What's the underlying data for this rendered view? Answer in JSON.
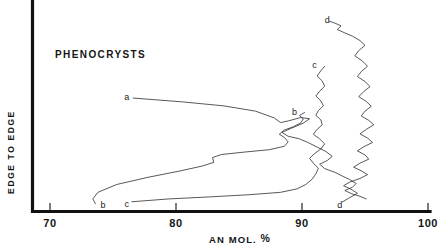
{
  "figure": {
    "title": "PHENOCRYSTS",
    "background_color": "#ffffff",
    "ink_color": "#161616",
    "curve_color": "#3a3a3a"
  },
  "chart_data": {
    "type": "line",
    "title": "PHENOCRYSTS",
    "xlabel": "AN MOL. %",
    "ylabel": "EDGE TO EDGE",
    "xlim": [
      70,
      100
    ],
    "ylim": [
      0,
      1
    ],
    "grid": false,
    "legend": "inline-curve-labels",
    "xticks": [
      70,
      80,
      90,
      100
    ],
    "xticklabels": [
      "70",
      "80",
      "90",
      "100"
    ],
    "yticks": [],
    "yticklabels": [],
    "axis_note": "Y axis is an unscaled traverse position: edge to edge across the crystal. X axis is anorthite content in mole percent.",
    "series": [
      {
        "name": "a",
        "label": "a",
        "label_position": {
          "x": 76.1,
          "y": 0.555
        },
        "points": [
          [
            76.6,
            0.552
          ],
          [
            80.5,
            0.533
          ],
          [
            83.8,
            0.513
          ],
          [
            86.3,
            0.487
          ],
          [
            87.8,
            0.453
          ],
          [
            88.3,
            0.43
          ],
          [
            88.9,
            0.438
          ],
          [
            89.9,
            0.455
          ],
          [
            90.6,
            0.449
          ],
          [
            90.1,
            0.427
          ],
          [
            89.2,
            0.403
          ],
          [
            88.4,
            0.381
          ],
          [
            88.9,
            0.362
          ],
          [
            89.8,
            0.349
          ],
          [
            90.5,
            0.33
          ],
          [
            91.2,
            0.308
          ],
          [
            91.9,
            0.286
          ],
          [
            92.4,
            0.262
          ],
          [
            92.0,
            0.241
          ],
          [
            91.4,
            0.223
          ],
          [
            91.8,
            0.201
          ],
          [
            92.6,
            0.183
          ],
          [
            93.2,
            0.164
          ],
          [
            93.8,
            0.146
          ],
          [
            94.3,
            0.127
          ],
          [
            94.0,
            0.108
          ],
          [
            93.4,
            0.092
          ],
          [
            93.9,
            0.077
          ],
          [
            94.6,
            0.063
          ],
          [
            95.1,
            0.05
          ]
        ]
      },
      {
        "name": "b",
        "label_bottom": "b",
        "label_top": "b",
        "label_bottom_position": {
          "x": 74.2,
          "y": 0.02
        },
        "label_top_position": {
          "x": 89.4,
          "y": 0.485
        },
        "points": [
          [
            73.6,
            0.027
          ],
          [
            73.4,
            0.05
          ],
          [
            73.8,
            0.083
          ],
          [
            75.3,
            0.122
          ],
          [
            77.8,
            0.158
          ],
          [
            80.3,
            0.189
          ],
          [
            82.1,
            0.214
          ],
          [
            83.0,
            0.232
          ],
          [
            82.9,
            0.256
          ],
          [
            83.6,
            0.271
          ],
          [
            85.4,
            0.283
          ],
          [
            87.4,
            0.295
          ],
          [
            88.6,
            0.312
          ],
          [
            88.9,
            0.334
          ],
          [
            88.6,
            0.356
          ],
          [
            88.2,
            0.372
          ],
          [
            88.6,
            0.393
          ],
          [
            89.3,
            0.409
          ],
          [
            89.9,
            0.428
          ],
          [
            90.1,
            0.448
          ],
          [
            89.8,
            0.465
          ],
          [
            90.2,
            0.48
          ]
        ]
      },
      {
        "name": "c",
        "label_bottom": "c",
        "label_top": "c",
        "label_bottom_position": {
          "x": 76.1,
          "y": 0.024
        },
        "label_top_position": {
          "x": 91.0,
          "y": 0.715
        },
        "points": [
          [
            76.5,
            0.036
          ],
          [
            79.4,
            0.05
          ],
          [
            82.6,
            0.06
          ],
          [
            85.8,
            0.071
          ],
          [
            88.3,
            0.083
          ],
          [
            89.6,
            0.1
          ],
          [
            90.3,
            0.122
          ],
          [
            90.8,
            0.148
          ],
          [
            91.1,
            0.175
          ],
          [
            91.3,
            0.203
          ],
          [
            90.9,
            0.228
          ],
          [
            90.6,
            0.252
          ],
          [
            91.0,
            0.276
          ],
          [
            91.5,
            0.299
          ],
          [
            91.8,
            0.324
          ],
          [
            91.4,
            0.349
          ],
          [
            90.9,
            0.372
          ],
          [
            91.2,
            0.396
          ],
          [
            91.6,
            0.419
          ],
          [
            91.5,
            0.443
          ],
          [
            91.1,
            0.466
          ],
          [
            91.3,
            0.49
          ],
          [
            91.7,
            0.513
          ],
          [
            91.5,
            0.538
          ],
          [
            91.1,
            0.562
          ],
          [
            91.4,
            0.586
          ],
          [
            91.8,
            0.611
          ],
          [
            91.6,
            0.637
          ],
          [
            91.2,
            0.662
          ],
          [
            91.5,
            0.688
          ],
          [
            91.8,
            0.71
          ]
        ]
      },
      {
        "name": "d",
        "label_bottom": "d",
        "label_top": "d",
        "label_bottom_position": {
          "x": 93.0,
          "y": 0.022
        },
        "label_top_position": {
          "x": 92.0,
          "y": 0.938
        },
        "points": [
          [
            93.2,
            0.035
          ],
          [
            93.8,
            0.057
          ],
          [
            94.4,
            0.078
          ],
          [
            93.9,
            0.098
          ],
          [
            93.3,
            0.116
          ],
          [
            93.8,
            0.134
          ],
          [
            94.6,
            0.152
          ],
          [
            95.2,
            0.171
          ],
          [
            94.7,
            0.19
          ],
          [
            94.1,
            0.208
          ],
          [
            94.6,
            0.228
          ],
          [
            95.3,
            0.248
          ],
          [
            95.0,
            0.269
          ],
          [
            94.4,
            0.289
          ],
          [
            94.9,
            0.31
          ],
          [
            95.6,
            0.331
          ],
          [
            95.2,
            0.353
          ],
          [
            94.6,
            0.374
          ],
          [
            95.1,
            0.396
          ],
          [
            95.7,
            0.419
          ],
          [
            95.3,
            0.441
          ],
          [
            94.7,
            0.463
          ],
          [
            95.0,
            0.487
          ],
          [
            95.5,
            0.511
          ],
          [
            95.1,
            0.535
          ],
          [
            94.5,
            0.559
          ],
          [
            94.9,
            0.584
          ],
          [
            95.4,
            0.609
          ],
          [
            95.0,
            0.634
          ],
          [
            94.4,
            0.659
          ],
          [
            94.7,
            0.684
          ],
          [
            95.2,
            0.71
          ],
          [
            94.8,
            0.736
          ],
          [
            94.2,
            0.762
          ],
          [
            94.5,
            0.788
          ],
          [
            95.0,
            0.814
          ],
          [
            94.6,
            0.838
          ],
          [
            94.0,
            0.86
          ],
          [
            93.4,
            0.876
          ],
          [
            92.8,
            0.893
          ],
          [
            93.1,
            0.911
          ],
          [
            92.6,
            0.925
          ],
          [
            92.2,
            0.934
          ]
        ]
      }
    ]
  }
}
